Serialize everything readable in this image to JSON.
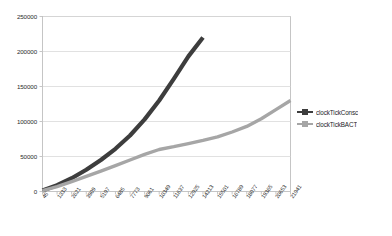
{
  "chart_data": {
    "type": "line",
    "title": "",
    "subtitle": "",
    "xlabel": "",
    "ylabel": "",
    "grid": true,
    "legend_position": "right",
    "xlim": [
      45,
      21941
    ],
    "ylim": [
      0,
      250000
    ],
    "yticks": [
      0,
      50000,
      100000,
      150000,
      200000,
      250000
    ],
    "ytick_labels": [
      "0",
      "50000",
      "100000",
      "150000",
      "200000",
      "250000"
    ],
    "categories": [
      45,
      1333,
      2621,
      3909,
      5197,
      6485,
      7773,
      9061,
      10349,
      11637,
      12925,
      14213,
      15501,
      16789,
      18077,
      19365,
      20653,
      21941
    ],
    "xtick_labels": [
      "45",
      "1333",
      "2621",
      "3909",
      "5197",
      "6485",
      "7773",
      "9061",
      "10349",
      "11637",
      "12925",
      "14213",
      "15501",
      "16789",
      "18077",
      "19365",
      "20653",
      "21941"
    ],
    "series": [
      {
        "name": "clockTickConsc",
        "color": "#3d3d3d",
        "marker": "square",
        "values": [
          1500,
          9000,
          19000,
          31000,
          45000,
          61000,
          80000,
          103000,
          130000,
          161000,
          193000,
          220000,
          null,
          null,
          null,
          null,
          null,
          null
        ]
      },
      {
        "name": "clockTickBACT",
        "color": "#a6a6a6",
        "marker": "square",
        "values": [
          1200,
          7000,
          14000,
          21500,
          29000,
          37000,
          45000,
          53000,
          60000,
          64000,
          68500,
          73000,
          78000,
          85000,
          93000,
          104000,
          117000,
          130000
        ]
      }
    ]
  },
  "legend": {
    "items": [
      {
        "label": "clockTickConsc",
        "color": "#3d3d3d"
      },
      {
        "label": "clockTickBACT",
        "color": "#a6a6a6"
      }
    ]
  },
  "colors": {
    "series_consc": "#3d3d3d",
    "series_bact": "#a6a6a6",
    "grid": "#d9d9d9",
    "axis": "#b7b7b7",
    "text": "#2b2b2b",
    "background": "#ffffff"
  }
}
